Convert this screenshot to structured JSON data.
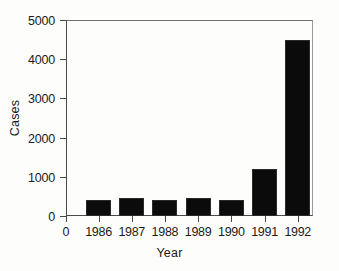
{
  "chart_data": {
    "type": "bar",
    "title": "",
    "subtitle": "",
    "xlabel": "Year",
    "ylabel": "Cases",
    "categories": [
      "1986",
      "1987",
      "1988",
      "1989",
      "1990",
      "1991",
      "1992"
    ],
    "values": [
      420,
      470,
      420,
      450,
      410,
      1200,
      4500
    ],
    "series": [
      {
        "name": "Cases",
        "values": [
          420,
          470,
          420,
          450,
          410,
          1200,
          4500
        ]
      }
    ],
    "ylim": [
      0,
      5000
    ],
    "ytick_values": [
      0,
      1000,
      2000,
      3000,
      4000,
      5000
    ],
    "ytick_labels": [
      "0",
      "1000",
      "2000",
      "3000",
      "4000",
      "5000"
    ],
    "xtick_labels": [
      "1986",
      "1987",
      "1988",
      "1989",
      "1990",
      "1991",
      "1992"
    ],
    "x_origin_label": "0",
    "grid": false,
    "legend": null,
    "legend_position": "none",
    "bar_color": "#0b0b0b",
    "axis_color": "#4a4a4a",
    "background_color": "#fdfdfc",
    "annotations": []
  }
}
